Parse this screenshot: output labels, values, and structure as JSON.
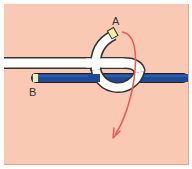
{
  "diagram": {
    "type": "knot-tying-step",
    "labels": {
      "end_a": "A",
      "end_b": "B"
    },
    "colors": {
      "background": "#f9c9b4",
      "rope_white": "#ffffff",
      "rope_outline": "#333333",
      "rope_blue": "#1f4a94",
      "rope_tip": "#f4eea0",
      "arrow": "#ee5a5a"
    }
  }
}
